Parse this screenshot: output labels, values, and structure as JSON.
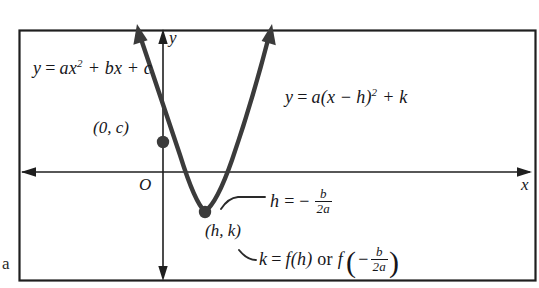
{
  "figure": {
    "type": "math-diagram",
    "border": {
      "visible": true,
      "color": "#1f1f1f"
    },
    "axes": {
      "x_label": "x",
      "y_label": "y",
      "origin_label": "O",
      "x_axis_y": 172,
      "y_axis_x": 163,
      "arrows": [
        "left",
        "right",
        "up",
        "down"
      ]
    },
    "curve": {
      "color": "#3b3b3b",
      "vertex_px": [
        205,
        212
      ],
      "y_intercept_px": [
        163,
        142
      ],
      "left_arrow_tip_px": [
        137,
        26
      ],
      "right_arrow_tip_px": [
        272,
        26
      ]
    },
    "points": [
      {
        "name": "y-intercept",
        "label": "(0, c)",
        "x": 97,
        "y": 120
      },
      {
        "name": "vertex",
        "label": "(h, k)",
        "x": 205,
        "y": 225
      }
    ],
    "equations": {
      "standard_form": {
        "lhs": "y",
        "eq": "=",
        "rhs_a": "ax",
        "exp": "2",
        "rhs_b": "+ bx + c",
        "full": "y = ax2 + bx + c"
      },
      "vertex_form": {
        "lhs": "y",
        "eq": "=",
        "rhs_a": "a(x −",
        "rhs_h": "h)",
        "exp": "2",
        "rhs_k": "+ k",
        "full": "y = a(x - h)2 + k"
      }
    },
    "annotations": {
      "h_formula": {
        "lead": "h",
        "eq": "= −",
        "num": "b",
        "den": "2a",
        "full": "h = -b/2a"
      },
      "k_formula": {
        "lead": "k",
        "eq": "=",
        "fh": "f(h)",
        "or": "or",
        "f": "f",
        "paren_open": "(",
        "minus": "−",
        "num": "b",
        "den": "2a",
        "paren_close": ")",
        "full": "k = f(h) or f(-b/2a)"
      }
    },
    "margin_mark": "a"
  }
}
